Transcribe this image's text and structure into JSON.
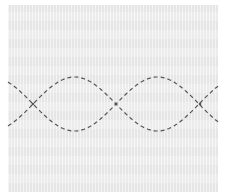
{
  "diagram": {
    "panel": {
      "x": 8,
      "y": 5,
      "width": 210,
      "height": 187,
      "color": "#ebebeb"
    },
    "stitch": {
      "color": "#555555",
      "dash": "4 3",
      "width": 1.2,
      "center_y": 104,
      "amplitude": 27,
      "period": 166,
      "x_start": 8,
      "x_end": 218,
      "crossings_x": [
        33,
        116,
        200
      ]
    }
  }
}
